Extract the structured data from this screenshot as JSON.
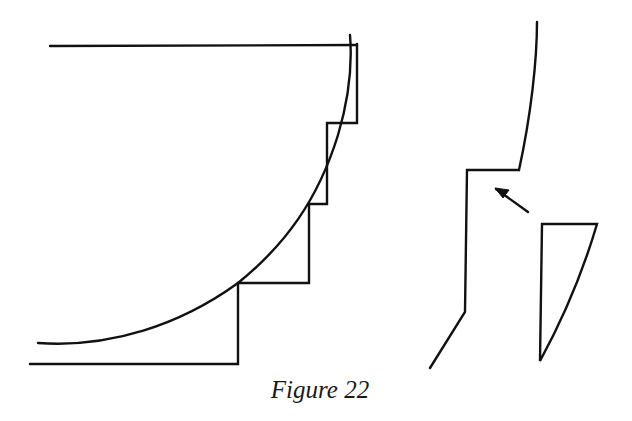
{
  "figure": {
    "caption": "Figure 22",
    "stroke_color": "#111111",
    "background": "#ffffff",
    "left_diagram": {
      "description": "Quarter-circle arc approximated by a stepped (staircase) profile",
      "top_line": {
        "x1": 50,
        "y1": 46,
        "x2": 357,
        "y2": 45
      },
      "steps": [
        {
          "x": 357,
          "y_top": 44,
          "y_bottom": 123
        },
        {
          "x": 327,
          "y_top": 123,
          "y_bottom": 204
        },
        {
          "x": 309,
          "y_top": 204,
          "y_bottom": 283
        },
        {
          "x": 238,
          "y_top": 283,
          "y_bottom": 364
        }
      ],
      "bottom_line": {
        "x1": 30,
        "y1": 364,
        "x2": 238,
        "y2": 364
      },
      "arc": {
        "start": [
          350,
          35
        ],
        "end": [
          38,
          343
        ]
      }
    },
    "right_diagram": {
      "description": "Profile with a notch; arrow indicates where the wedge piece fits",
      "profile_points": [
        [
          537,
          22
        ],
        [
          519,
          170
        ],
        [
          467,
          170
        ],
        [
          465,
          312
        ],
        [
          430,
          368
        ]
      ],
      "arrow": {
        "from": [
          528,
          212
        ],
        "to": [
          495,
          188
        ]
      },
      "wedge": {
        "points": [
          [
            542,
            224
          ],
          [
            597,
            224
          ],
          [
            540,
            361
          ]
        ]
      }
    }
  }
}
